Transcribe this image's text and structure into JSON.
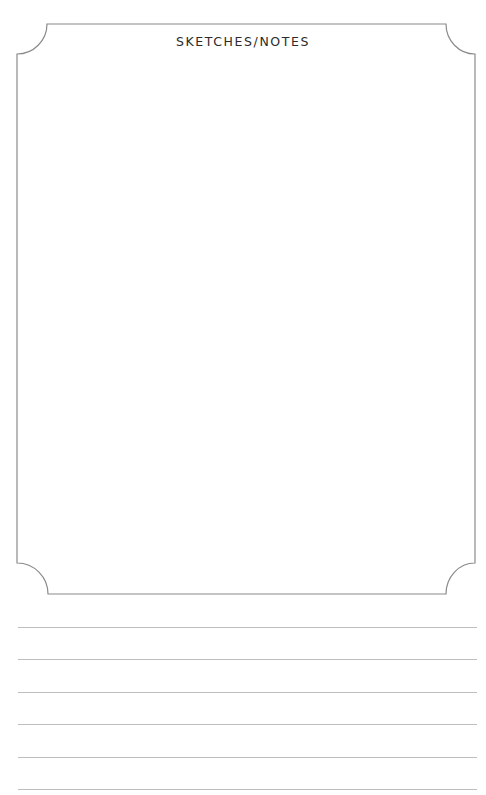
{
  "page": {
    "title": "SKETCHES/NOTES",
    "frame": {
      "stroke_color": "#8a8a8a",
      "corner_style": "inverted-rounded"
    },
    "ruled_lines": {
      "count": 6,
      "color": "#bdbdbd",
      "y_positions": [
        627,
        659,
        692,
        724,
        757,
        789
      ]
    }
  }
}
